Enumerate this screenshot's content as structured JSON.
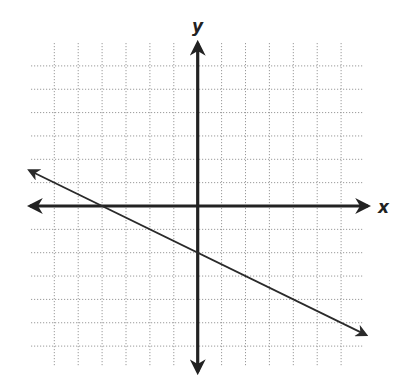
{
  "chart_data": {
    "type": "line",
    "title": "",
    "xlabel": "x",
    "ylabel": "y",
    "grid": true,
    "grid_style": "dotted",
    "xlim": [
      -6,
      6
    ],
    "ylim": [
      -6,
      6
    ],
    "tick_labels": false,
    "series": [
      {
        "name": "line",
        "equation": "y = -0.5x - 2",
        "slope": -0.5,
        "y_intercept": -2,
        "x_intercept": -4,
        "x": [
          -7,
          7
        ],
        "y": [
          1.5,
          -5.5
        ],
        "arrows_both_ends": true
      }
    ]
  },
  "labels": {
    "x": "x",
    "y": "y"
  },
  "colors": {
    "axis": "#222222",
    "grid": "#9a9a9a",
    "line": "#2a2a2a"
  }
}
